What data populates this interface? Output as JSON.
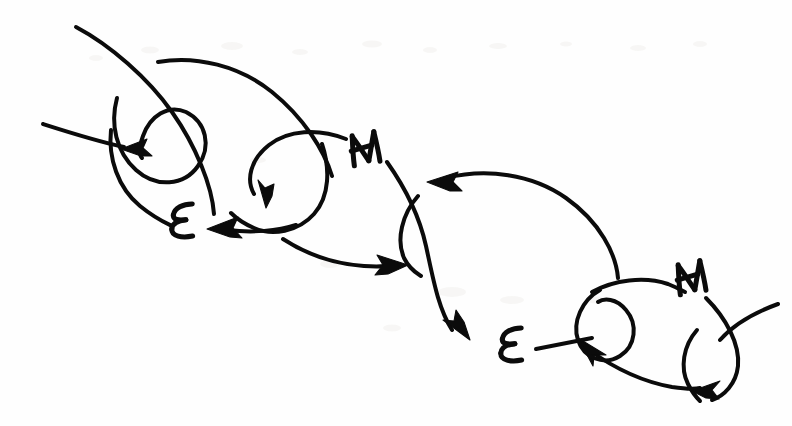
{
  "figure": {
    "title": "Hand-drawn electromagnetic chain sketch",
    "medium": "pen on paper, scanned",
    "ink_color": "#0b0b0b",
    "paper_color": "#fefefe",
    "width_px": 792,
    "height_px": 426
  },
  "labels": [
    {
      "id": "label-e-1",
      "text": "E",
      "x": 183,
      "y": 221,
      "rotation": -6,
      "scale": 1.0
    },
    {
      "id": "label-m-1",
      "text": "M",
      "x": 366,
      "y": 148,
      "rotation": -8,
      "scale": 1.0
    },
    {
      "id": "label-e-2",
      "text": "E",
      "x": 512,
      "y": 345,
      "rotation": -6,
      "scale": 1.0
    },
    {
      "id": "label-m-2",
      "text": "M",
      "x": 692,
      "y": 277,
      "rotation": -8,
      "scale": 1.0
    }
  ],
  "strokes": {
    "unit_1": {
      "name": "upper-left loop unit",
      "arrow_count": 2
    },
    "unit_2": {
      "name": "middle loop unit",
      "arrow_count": 3
    },
    "unit_3": {
      "name": "lower-right loop unit",
      "arrow_count": 2
    }
  },
  "arrowheads": [
    {
      "id": "arrow-left-upper",
      "x": 130,
      "y": 150,
      "direction": "left"
    },
    {
      "id": "arrow-down-mid",
      "x": 268,
      "y": 196,
      "direction": "down"
    },
    {
      "id": "arrow-left-to-e1",
      "x": 218,
      "y": 228,
      "direction": "left"
    },
    {
      "id": "arrow-right-mid",
      "x": 397,
      "y": 264,
      "direction": "right"
    },
    {
      "id": "arrow-left-upper-2",
      "x": 437,
      "y": 182,
      "direction": "left"
    },
    {
      "id": "arrow-down-right",
      "x": 463,
      "y": 330,
      "direction": "down-right"
    },
    {
      "id": "arrow-left-to-e2",
      "x": 594,
      "y": 341,
      "direction": "up-left"
    },
    {
      "id": "arrow-down-far",
      "x": 706,
      "y": 390,
      "direction": "down-left"
    }
  ],
  "legend": {
    "e_meaning": "E",
    "m_meaning": "M"
  }
}
